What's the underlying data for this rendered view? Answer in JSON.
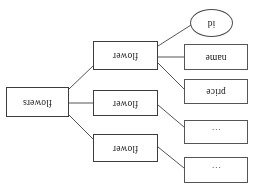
{
  "diagram": {
    "type": "er-diagram",
    "orientation": "rotated-180",
    "style": {
      "background": "#ffffff",
      "border_color": "#4a4a4a",
      "text_color": "#1a1a1a",
      "line_color": "#555555"
    },
    "nodes": [
      {
        "id": "attr_ellipsis_top",
        "label": "...",
        "shape": "rectangle",
        "role": "attribute",
        "x": 9,
        "y": 2,
        "w": 64,
        "h": 26
      },
      {
        "id": "attr_ellipsis_second",
        "label": "...",
        "shape": "rectangle",
        "role": "attribute",
        "x": 9,
        "y": 41,
        "w": 64,
        "h": 24
      },
      {
        "id": "attr_price",
        "label": "price",
        "shape": "rectangle",
        "role": "attribute",
        "x": 9,
        "y": 81,
        "w": 64,
        "h": 25
      },
      {
        "id": "attr_name",
        "label": "name",
        "shape": "rectangle",
        "role": "attribute",
        "x": 9,
        "y": 115,
        "w": 64,
        "h": 26
      },
      {
        "id": "attr_id",
        "label": "id",
        "shape": "ellipse",
        "role": "key-attribute",
        "x": 24,
        "y": 148,
        "w": 43,
        "h": 28
      },
      {
        "id": "entity_flower_1",
        "label": "flower",
        "shape": "rectangle",
        "role": "entity",
        "x": 99,
        "y": 23,
        "w": 65,
        "h": 28
      },
      {
        "id": "entity_flower_2",
        "label": "flower",
        "shape": "rectangle",
        "role": "entity",
        "x": 99,
        "y": 69,
        "w": 65,
        "h": 26
      },
      {
        "id": "entity_flower_3",
        "label": "flower",
        "shape": "rectangle",
        "role": "entity",
        "x": 99,
        "y": 115,
        "w": 65,
        "h": 29
      },
      {
        "id": "entity_flowers",
        "label": "flowers",
        "shape": "rectangle",
        "role": "entity",
        "x": 188,
        "y": 68,
        "w": 63,
        "h": 30
      }
    ],
    "edges": [
      {
        "id": "edge_ellipsis_top_to_flower1",
        "from": "attr_ellipsis_top",
        "to": "entity_flower_1",
        "x1": 73,
        "y1": 17,
        "x2": 99,
        "y2": 38
      },
      {
        "id": "edge_ellipsis_second_to_flower2",
        "from": "attr_ellipsis_second",
        "to": "entity_flower_2",
        "x1": 73,
        "y1": 58,
        "x2": 99,
        "y2": 80
      },
      {
        "id": "edge_price_to_flower3",
        "from": "attr_price",
        "to": "entity_flower_3",
        "x1": 73,
        "y1": 96,
        "x2": 99,
        "y2": 122
      },
      {
        "id": "edge_name_to_flower3",
        "from": "attr_name",
        "to": "entity_flower_3",
        "x1": 73,
        "y1": 128,
        "x2": 99,
        "y2": 128
      },
      {
        "id": "edge_id_to_flower3",
        "from": "attr_id",
        "to": "entity_flower_3",
        "x1": 66,
        "y1": 160,
        "x2": 99,
        "y2": 139
      },
      {
        "id": "edge_flower1_to_flowers",
        "from": "entity_flower_1",
        "to": "entity_flowers",
        "x1": 164,
        "y1": 46,
        "x2": 188,
        "y2": 70
      },
      {
        "id": "edge_flower2_to_flowers",
        "from": "entity_flower_2",
        "to": "entity_flowers",
        "x1": 164,
        "y1": 82,
        "x2": 188,
        "y2": 82
      },
      {
        "id": "edge_flower3_to_flowers",
        "from": "entity_flower_3",
        "to": "entity_flowers",
        "x1": 164,
        "y1": 119,
        "x2": 188,
        "y2": 96
      }
    ]
  }
}
